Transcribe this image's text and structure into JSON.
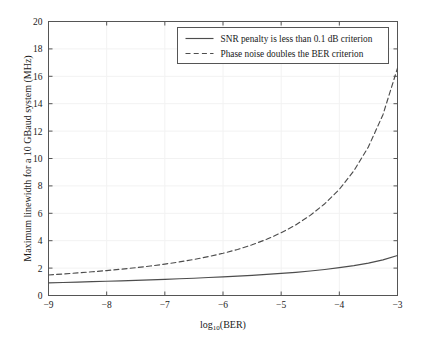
{
  "chart_data": {
    "type": "line",
    "title": "",
    "xlabel": "log10(BER)",
    "xlabel_main": "log",
    "xlabel_sub": "10",
    "xlabel_tail": "(BER)",
    "ylabel": "Maximum linewidth for a 10 GBaud system (MHz)",
    "xlim": [
      -9,
      -3
    ],
    "ylim": [
      0,
      20
    ],
    "xticks": [
      -9,
      -8,
      -7,
      -6,
      -5,
      -4,
      -3
    ],
    "xtick_labels": [
      "−9",
      "−8",
      "−7",
      "−6",
      "−5",
      "−4",
      "−3"
    ],
    "yticks": [
      0,
      2,
      4,
      6,
      8,
      10,
      12,
      14,
      16,
      18,
      20
    ],
    "ytick_labels": [
      "0",
      "2",
      "4",
      "6",
      "8",
      "10",
      "12",
      "14",
      "16",
      "18",
      "20"
    ],
    "grid": true,
    "grid_color": "#f2f2f2",
    "axis_color": "#555555",
    "legend_position": "top-right",
    "series": [
      {
        "name": "SNR penalty is less than 0.1 dB criterion",
        "style": "solid",
        "color": "#4d4d4d",
        "x": [
          -9.0,
          -8.75,
          -8.5,
          -8.25,
          -8.0,
          -7.75,
          -7.5,
          -7.25,
          -7.0,
          -6.75,
          -6.5,
          -6.25,
          -6.0,
          -5.75,
          -5.5,
          -5.25,
          -5.0,
          -4.75,
          -4.5,
          -4.25,
          -4.0,
          -3.75,
          -3.5,
          -3.25,
          -3.0
        ],
        "values": [
          0.92,
          0.95,
          0.98,
          1.01,
          1.04,
          1.07,
          1.1,
          1.14,
          1.18,
          1.22,
          1.26,
          1.31,
          1.36,
          1.41,
          1.47,
          1.54,
          1.61,
          1.69,
          1.79,
          1.9,
          2.03,
          2.18,
          2.36,
          2.6,
          2.92
        ]
      },
      {
        "name": "Phase noise doubles the BER criterion",
        "style": "dashed",
        "color": "#4d4d4d",
        "x": [
          -9.0,
          -8.75,
          -8.5,
          -8.25,
          -8.0,
          -7.75,
          -7.5,
          -7.25,
          -7.0,
          -6.75,
          -6.5,
          -6.25,
          -6.0,
          -5.75,
          -5.5,
          -5.25,
          -5.0,
          -4.75,
          -4.5,
          -4.25,
          -4.0,
          -3.75,
          -3.5,
          -3.25,
          -3.0
        ],
        "values": [
          1.5,
          1.57,
          1.65,
          1.73,
          1.82,
          1.92,
          2.03,
          2.15,
          2.29,
          2.45,
          2.63,
          2.84,
          3.08,
          3.36,
          3.7,
          4.1,
          4.58,
          5.15,
          5.85,
          6.7,
          7.75,
          9.1,
          10.85,
          13.2,
          16.6
        ]
      }
    ]
  },
  "legend": {
    "entries": [
      {
        "label": "SNR penalty is less than 0.1 dB criterion",
        "style": "solid"
      },
      {
        "label": "Phase noise doubles the BER criterion",
        "style": "dashed"
      }
    ]
  }
}
